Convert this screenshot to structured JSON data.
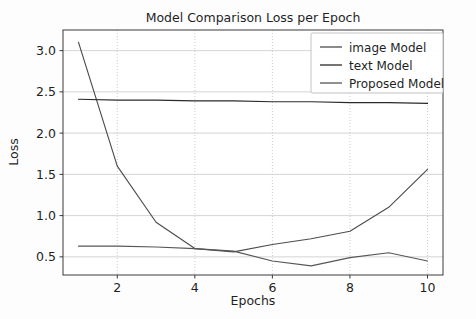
{
  "chart_data": {
    "type": "line",
    "title": "Model Comparison Loss per Epoch",
    "xlabel": "Epochs",
    "ylabel": "Loss",
    "x": [
      1,
      2,
      3,
      4,
      5,
      6,
      7,
      8,
      9,
      10
    ],
    "xlim": [
      0.6,
      10.4
    ],
    "ylim": [
      0.28,
      3.25
    ],
    "xticks": [
      2,
      4,
      6,
      8,
      10
    ],
    "xtick_labels": [
      "2",
      "4",
      "6",
      "8",
      "10"
    ],
    "yticks": [
      0.5,
      1.0,
      1.5,
      2.0,
      2.5,
      3.0
    ],
    "ytick_labels": [
      "0.5",
      "1.0",
      "1.5",
      "2.0",
      "2.5",
      "3.0"
    ],
    "grid": true,
    "legend_position": "upper right",
    "series": [
      {
        "name": "image Model",
        "color": "#4d4d4d",
        "values": [
          3.1,
          1.6,
          0.92,
          0.6,
          0.56,
          0.65,
          0.72,
          0.81,
          1.1,
          1.56
        ]
      },
      {
        "name": "text Model",
        "color": "#2b2b2b",
        "values": [
          2.41,
          2.4,
          2.4,
          2.39,
          2.39,
          2.38,
          2.38,
          2.37,
          2.37,
          2.36
        ]
      },
      {
        "name": "Proposed Model",
        "color": "#565656",
        "values": [
          0.63,
          0.63,
          0.62,
          0.6,
          0.57,
          0.45,
          0.39,
          0.49,
          0.55,
          0.45
        ]
      }
    ]
  },
  "legend": {
    "entries": [
      {
        "label": "image Model"
      },
      {
        "label": "text Model"
      },
      {
        "label": "Proposed Model"
      }
    ]
  },
  "colors": {
    "background": "#fdfdfd",
    "axis": "#3a3a3a",
    "grid": "#c9c9c9",
    "text": "#1f1f1f"
  }
}
